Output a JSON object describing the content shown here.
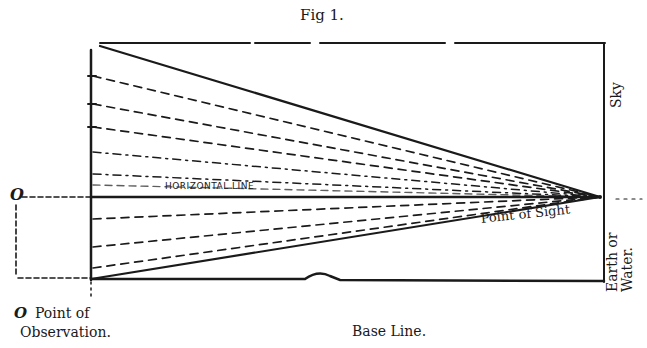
{
  "figure": {
    "title": "Fig 1.",
    "labels": {
      "horizontal_line": "HORIZONTAL LINE",
      "point_of_sight": "Point of Sight",
      "sky": "Sky",
      "earth_or": "Earth or",
      "water": "Water.",
      "o_left": "O",
      "o_bottom": "O",
      "point_of": "Point of",
      "observation": "Observation.",
      "base_line": "Base Line."
    },
    "colors": {
      "ink": "#1a1a1a",
      "paper": "#ffffff"
    },
    "geometry": {
      "vanishing_point": [
        600,
        197
      ],
      "observer_x": 91,
      "horizon_y": 197,
      "base_y": 279,
      "frame_top_y": 43,
      "frame_right_x": 604,
      "dashed_rays_above_start_y": [
        76,
        106,
        129,
        153,
        176
      ],
      "dashed_rays_below_start_y": [
        220,
        248,
        268
      ],
      "solid_rays": [
        [
          100,
          46
        ],
        [
          91,
          279
        ]
      ]
    }
  }
}
